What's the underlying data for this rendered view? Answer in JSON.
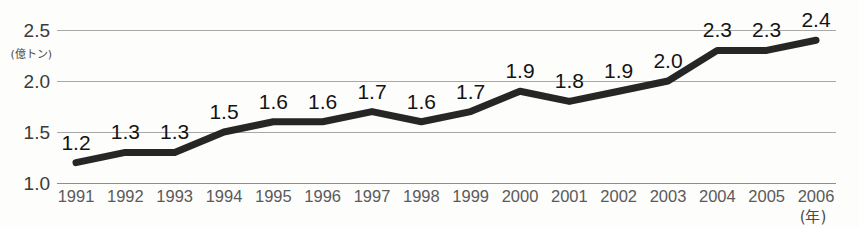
{
  "chart_data": {
    "type": "line",
    "title": "",
    "subtitle": "",
    "xlabel": "(年)",
    "ylabel": "(億トン)",
    "categories": [
      "1991",
      "1992",
      "1993",
      "1994",
      "1995",
      "1996",
      "1997",
      "1998",
      "1999",
      "2000",
      "2001",
      "2002",
      "2003",
      "2004",
      "2005",
      "2006"
    ],
    "values": [
      1.2,
      1.3,
      1.3,
      1.5,
      1.6,
      1.6,
      1.7,
      1.6,
      1.7,
      1.9,
      1.8,
      1.9,
      2.0,
      2.3,
      2.3,
      2.4
    ],
    "point_labels": [
      "1.2",
      "1.3",
      "1.3",
      "1.5",
      "1.6",
      "1.6",
      "1.7",
      "1.6",
      "1.7",
      "1.9",
      "1.8",
      "1.9",
      "2.0",
      "2.3",
      "2.3",
      "2.4"
    ],
    "ylim": [
      1.0,
      2.5
    ],
    "yticks": [
      1.0,
      1.5,
      2.0,
      2.5
    ],
    "ytick_labels": [
      "1.0",
      "1.5",
      "2.0",
      "2.5"
    ],
    "grid": true,
    "grid_axis": "y",
    "legend": false,
    "legend_position": "none",
    "series": [
      {
        "name": "",
        "values": [
          1.2,
          1.3,
          1.3,
          1.5,
          1.6,
          1.6,
          1.7,
          1.6,
          1.7,
          1.9,
          1.8,
          1.9,
          2.0,
          2.3,
          2.3,
          2.4
        ]
      }
    ],
    "colors": {
      "line": "#262626",
      "gridline": "#a8a8a8",
      "baseline": "#8f8f8f",
      "label_text": "#141414",
      "tick_text": "#5a5a5a",
      "background": "#fdfdfc"
    },
    "line_width": 7
  }
}
